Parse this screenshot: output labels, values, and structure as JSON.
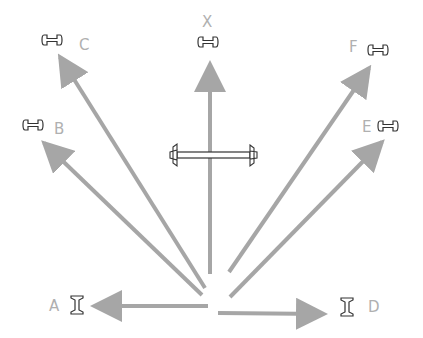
{
  "diagram": {
    "colors": {
      "arrow": "#a6a6a6",
      "label": "#b0b0b0",
      "icon_stroke": "#333333",
      "background": "#ffffff"
    },
    "labels": {
      "A": "A",
      "B": "B",
      "C": "C",
      "D": "D",
      "E": "E",
      "F": "F",
      "X": "X"
    },
    "arrows": [
      {
        "id": "A",
        "direction": "left"
      },
      {
        "id": "B",
        "direction": "up-left"
      },
      {
        "id": "C",
        "direction": "up-left steep"
      },
      {
        "id": "X",
        "direction": "up"
      },
      {
        "id": "F",
        "direction": "up-right steep"
      },
      {
        "id": "E",
        "direction": "up-right"
      },
      {
        "id": "D",
        "direction": "right"
      }
    ],
    "markers": {
      "A": "vertical-spool-icon",
      "D": "vertical-spool-icon",
      "B": "horizontal-spool-icon",
      "C": "horizontal-spool-icon",
      "X": "horizontal-spool-icon",
      "E": "horizontal-spool-icon",
      "F": "horizontal-spool-icon"
    },
    "central_object": "horizontal-bar-with-end-caps"
  }
}
